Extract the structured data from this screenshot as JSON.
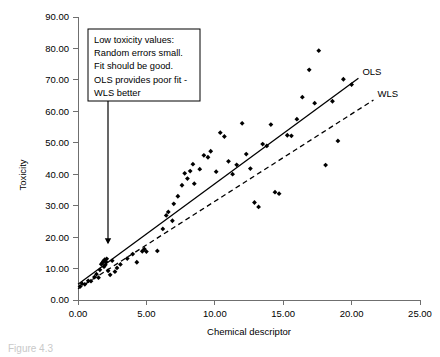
{
  "chart_data": {
    "type": "scatter",
    "title": "",
    "xlabel": "Chemical descriptor",
    "ylabel": "Toxicity",
    "xlim": [
      0,
      25
    ],
    "ylim": [
      0,
      90
    ],
    "grid": false,
    "xticks": [
      "0.00",
      "5.00",
      "10.00",
      "15.00",
      "20.00",
      "25.00"
    ],
    "yticks": [
      "0.00",
      "10.00",
      "20.00",
      "30.00",
      "40.00",
      "50.00",
      "60.00",
      "70.00",
      "80.00",
      "90.00"
    ],
    "xtick_values": [
      0,
      5,
      10,
      15,
      20,
      25
    ],
    "ytick_values": [
      0,
      10,
      20,
      30,
      40,
      50,
      60,
      70,
      80,
      90
    ],
    "points": [
      [
        0.15,
        4.3
      ],
      [
        0.3,
        5.2
      ],
      [
        0.5,
        5.0
      ],
      [
        0.75,
        6.1
      ],
      [
        0.95,
        6.0
      ],
      [
        1.2,
        7.3
      ],
      [
        1.35,
        8.2
      ],
      [
        1.5,
        7.1
      ],
      [
        1.6,
        9.6
      ],
      [
        1.7,
        11.4
      ],
      [
        1.8,
        11.9
      ],
      [
        1.85,
        12.3
      ],
      [
        1.9,
        10.6
      ],
      [
        1.95,
        12.8
      ],
      [
        2.0,
        11.2
      ],
      [
        2.05,
        12.1
      ],
      [
        2.1,
        13.1
      ],
      [
        2.2,
        9.3
      ],
      [
        2.35,
        8.0
      ],
      [
        2.5,
        12.5
      ],
      [
        2.7,
        9.0
      ],
      [
        2.85,
        10.2
      ],
      [
        3.1,
        11.3
      ],
      [
        3.6,
        13.2
      ],
      [
        4.0,
        14.6
      ],
      [
        4.3,
        12.0
      ],
      [
        4.7,
        15.5
      ],
      [
        4.85,
        16.2
      ],
      [
        5.0,
        15.4
      ],
      [
        5.8,
        15.6
      ],
      [
        6.2,
        22.6
      ],
      [
        6.45,
        26.9
      ],
      [
        6.6,
        28.0
      ],
      [
        6.9,
        25.2
      ],
      [
        7.0,
        30.6
      ],
      [
        7.3,
        33.0
      ],
      [
        7.6,
        36.5
      ],
      [
        7.8,
        40.3
      ],
      [
        8.0,
        38.6
      ],
      [
        8.2,
        41.0
      ],
      [
        8.4,
        43.2
      ],
      [
        8.5,
        37.0
      ],
      [
        8.9,
        41.6
      ],
      [
        9.2,
        46.0
      ],
      [
        9.5,
        45.4
      ],
      [
        9.7,
        47.3
      ],
      [
        10.1,
        40.8
      ],
      [
        10.4,
        53.2
      ],
      [
        10.7,
        52.0
      ],
      [
        11.0,
        44.1
      ],
      [
        11.3,
        40.0
      ],
      [
        11.6,
        43.0
      ],
      [
        12.0,
        56.2
      ],
      [
        12.3,
        46.4
      ],
      [
        12.6,
        41.8
      ],
      [
        12.9,
        31.0
      ],
      [
        13.2,
        29.6
      ],
      [
        13.5,
        49.6
      ],
      [
        13.8,
        49.0
      ],
      [
        14.1,
        55.8
      ],
      [
        14.4,
        34.3
      ],
      [
        14.7,
        33.8
      ],
      [
        15.3,
        52.4
      ],
      [
        15.6,
        52.2
      ],
      [
        16.0,
        57.5
      ],
      [
        16.4,
        64.5
      ],
      [
        16.9,
        73.2
      ],
      [
        17.3,
        62.6
      ],
      [
        17.6,
        79.3
      ],
      [
        18.1,
        42.9
      ],
      [
        18.6,
        63.2
      ],
      [
        19.0,
        50.6
      ],
      [
        19.4,
        70.2
      ],
      [
        20.0,
        68.5
      ]
    ],
    "fits": [
      {
        "name": "OLS",
        "style": "solid",
        "label": "OLS",
        "x0": 0.0,
        "y0": 5.0,
        "x1": 20.5,
        "y1": 70.5
      },
      {
        "name": "WLS",
        "style": "dashed",
        "label": "WLS",
        "x0": 0.0,
        "y0": 3.6,
        "x1": 21.6,
        "y1": 63.6
      }
    ],
    "annotations": [
      {
        "name": "low-toxicity-note",
        "lines": [
          "Low toxicity values:",
          "Random errors small.",
          "Fit should be good.",
          "OLS provides poor fit -",
          "WLS better"
        ],
        "arrow_to_x": 2.6,
        "arrow_to_y": 16.0
      }
    ]
  },
  "caption": {
    "text": "Figure 4.3"
  }
}
